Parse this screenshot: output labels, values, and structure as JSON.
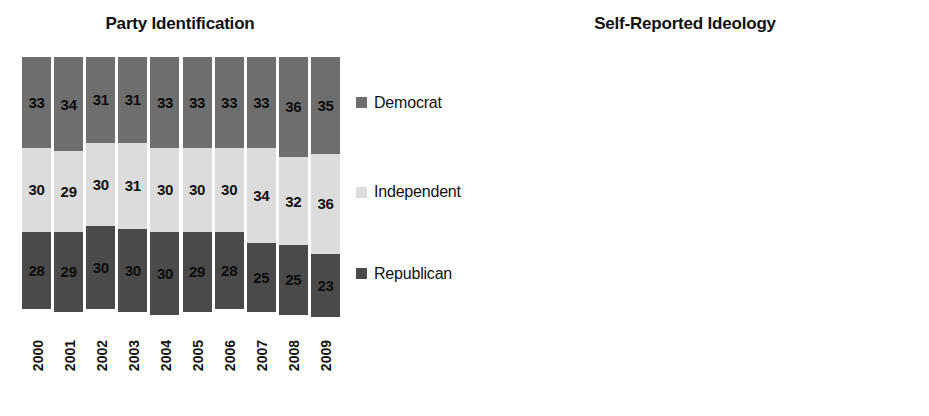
{
  "charts": [
    {
      "id": "party",
      "title": "Party Identification",
      "years": [
        "2000",
        "2001",
        "2002",
        "2003",
        "2004",
        "2005",
        "2006",
        "2007",
        "2008",
        "2009"
      ],
      "series": [
        {
          "name": "Democrat",
          "tone": "mid",
          "color": "#6e6e6e",
          "values": [
            33,
            34,
            31,
            31,
            33,
            33,
            33,
            33,
            36,
            35
          ]
        },
        {
          "name": "Independent",
          "tone": "light",
          "color": "#dcdcdc",
          "values": [
            30,
            29,
            30,
            31,
            30,
            30,
            30,
            34,
            32,
            36
          ]
        },
        {
          "name": "Republican",
          "tone": "dark",
          "color": "#4a4a4a",
          "values": [
            28,
            29,
            30,
            30,
            30,
            29,
            28,
            25,
            25,
            23
          ]
        }
      ]
    },
    {
      "id": "ideology",
      "title": "Self-Reported Ideology",
      "years": [
        "2000",
        "2001",
        "2002",
        "2003",
        "2004",
        "2005",
        "2006",
        "2007",
        "2008",
        "2009"
      ],
      "series": [
        {
          "name": "Liberal",
          "tone": "mid",
          "color": "#6e6e6e",
          "values": [
            18,
            19,
            18,
            18,
            19,
            20,
            20,
            19,
            21,
            19
          ]
        },
        {
          "name": "Moderate",
          "tone": "light",
          "color": "#dcdcdc",
          "values": [
            37,
            38,
            39,
            39,
            39,
            38,
            38,
            39,
            36,
            38
          ]
        },
        {
          "name": "Conservative",
          "tone": "dark",
          "color": "#4a4a4a",
          "values": [
            null,
            null,
            null,
            null,
            null,
            null,
            null,
            null,
            null,
            null
          ]
        }
      ]
    }
  ],
  "chart_data": [
    {
      "type": "bar",
      "subtype": "stacked-100-percent",
      "title": "Party Identification",
      "xlabel": "",
      "ylabel": "",
      "ylim": [
        0,
        100
      ],
      "grid": false,
      "legend_position": "right",
      "categories": [
        "2000",
        "2001",
        "2002",
        "2003",
        "2004",
        "2005",
        "2006",
        "2007",
        "2008",
        "2009"
      ],
      "series": [
        {
          "name": "Democrat",
          "values": [
            33,
            34,
            31,
            31,
            33,
            33,
            33,
            33,
            36,
            35
          ],
          "color": "#6e6e6e",
          "labels_shown": true
        },
        {
          "name": "Independent",
          "values": [
            30,
            29,
            30,
            31,
            30,
            30,
            30,
            34,
            32,
            36
          ],
          "color": "#dcdcdc",
          "labels_shown": true
        },
        {
          "name": "Republican",
          "values": [
            28,
            29,
            30,
            30,
            30,
            29,
            28,
            25,
            25,
            23
          ],
          "color": "#4a4a4a",
          "labels_shown": true
        }
      ],
      "stack_order_top_to_bottom": [
        "Democrat",
        "Independent",
        "Republican"
      ]
    },
    {
      "type": "bar",
      "subtype": "stacked-100-percent",
      "title": "Self-Reported Ideology",
      "xlabel": "",
      "ylabel": "",
      "ylim": [
        0,
        100
      ],
      "grid": false,
      "legend_position": "right",
      "categories": [
        "2000",
        "2001",
        "2002",
        "2003",
        "2004",
        "2005",
        "2006",
        "2007",
        "2008",
        "2009"
      ],
      "series": [
        {
          "name": "Liberal",
          "values": [
            18,
            19,
            18,
            18,
            19,
            20,
            20,
            19,
            21,
            19
          ],
          "color": "#6e6e6e",
          "labels_shown": true
        },
        {
          "name": "Moderate",
          "values": [
            37,
            38,
            39,
            39,
            39,
            38,
            38,
            39,
            36,
            38
          ],
          "color": "#dcdcdc",
          "labels_shown": true
        },
        {
          "name": "Conservative",
          "values": [
            45,
            43,
            43,
            43,
            42,
            42,
            42,
            42,
            43,
            43
          ],
          "color": "#4a4a4a",
          "labels_shown": false
        }
      ],
      "stack_order_top_to_bottom": [
        "Liberal",
        "Moderate",
        "Conservative"
      ]
    }
  ]
}
